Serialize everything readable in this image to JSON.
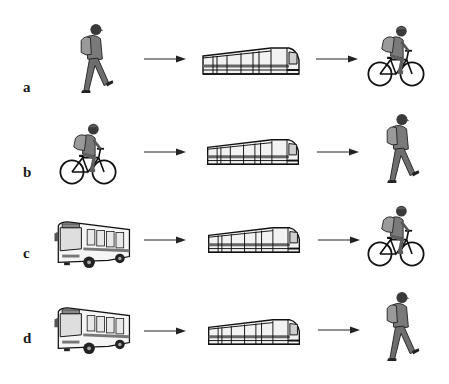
{
  "diagram": {
    "type": "transport-mode-sequences",
    "rows": [
      {
        "label": "a",
        "steps": [
          "walk",
          "train",
          "bicycle"
        ]
      },
      {
        "label": "b",
        "steps": [
          "bicycle",
          "train",
          "walk"
        ]
      },
      {
        "label": "c",
        "steps": [
          "bus",
          "train",
          "bicycle"
        ]
      },
      {
        "label": "d",
        "steps": [
          "bus",
          "train",
          "walk"
        ]
      }
    ],
    "connector": "arrow-right",
    "colors": {
      "ink": "#1a1a1a",
      "shade": "#8a8a8a",
      "light": "#d6d6d6",
      "background": "#ffffff"
    }
  }
}
